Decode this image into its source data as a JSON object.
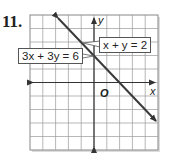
{
  "problem_number": "11.",
  "graph": {
    "x_axis_label": "x",
    "y_axis_label": "y",
    "origin_label": "O",
    "grid": {
      "columns": 10,
      "rows": 10,
      "x_range": [
        -5,
        5
      ],
      "y_range": [
        -5,
        5
      ]
    },
    "lines": [
      {
        "equation": "x + y = 2",
        "color": "#3a3a3a"
      },
      {
        "equation": "3x + 3y = 6",
        "color": "#3a3a3a"
      }
    ],
    "labels": {
      "line1": "x + y = 2",
      "line2": "3x + 3y = 6"
    }
  }
}
